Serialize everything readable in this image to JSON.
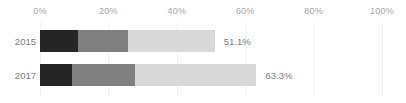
{
  "chart_data": {
    "type": "bar",
    "orientation": "horizontal",
    "stacked": true,
    "title": "",
    "subtitle": "",
    "xlabel": "",
    "ylabel": "",
    "xlim": [
      0,
      100
    ],
    "grid": true,
    "legend": null,
    "xtick_labels": [
      "0%",
      "20%",
      "40%",
      "60%",
      "80%",
      "100%"
    ],
    "xtick_values": [
      0,
      20,
      40,
      60,
      80,
      100
    ],
    "categories": [
      "2015",
      "2017"
    ],
    "series": [
      {
        "name": "segment-1",
        "color": "#262626",
        "values": [
          11.1,
          9.4
        ]
      },
      {
        "name": "segment-2",
        "color": "#808080",
        "values": [
          14.6,
          18.4
        ]
      },
      {
        "name": "segment-3",
        "color": "#d9d9d9",
        "values": [
          25.4,
          35.5
        ]
      }
    ],
    "totals": [
      51.1,
      63.3
    ],
    "total_labels": [
      "51.1%",
      "63.3%"
    ],
    "colors": {
      "segment_dark": "#262626",
      "segment_medium": "#808080",
      "segment_light": "#d9d9d9",
      "gridline": "#f2f2f2",
      "tick_text": "#a6a6a6",
      "label_text": "#808080",
      "background": "#ffffff"
    }
  },
  "layout": {
    "plot_left_px": 40,
    "plot_right_px": 382,
    "bar_height_px": 22,
    "row_tops_px": [
      30,
      64
    ],
    "label_gap_px": 9
  }
}
